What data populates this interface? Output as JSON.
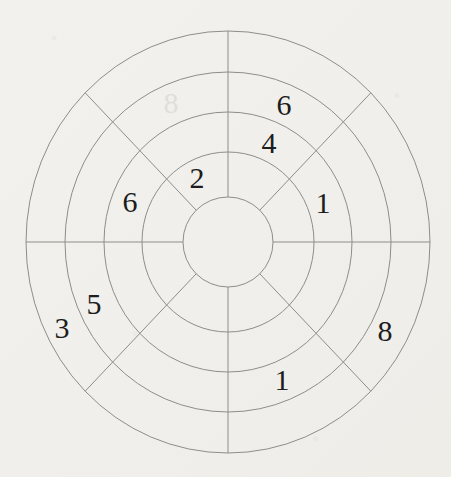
{
  "figure": {
    "kind": "concentric-ring-sector-puzzle",
    "background_color": "#f1f0ec",
    "line_color": "#8d8d8d",
    "text_color": "#1d1d1d",
    "ghost_color": "#bcbbb1",
    "center": {
      "x": 228,
      "y": 242
    },
    "radii_x": [
      45,
      86,
      124,
      163,
      202
    ],
    "radii_y": [
      45,
      90,
      130,
      170,
      211
    ],
    "num_rings": 4,
    "num_sectors": 8,
    "spoke_angles_deg": [
      0,
      45,
      90,
      135,
      180,
      225,
      270,
      315
    ],
    "entries": [
      {
        "value": "6",
        "ring": 3,
        "sector": "N-NE",
        "x": 284,
        "y": 104
      },
      {
        "value": "4",
        "ring": 2,
        "sector": "N-NE",
        "x": 269,
        "y": 142
      },
      {
        "value": "1",
        "ring": 2,
        "sector": "NE-E",
        "x": 323,
        "y": 202
      },
      {
        "value": "8",
        "ring": 4,
        "sector": "E-SE",
        "x": 385,
        "y": 330
      },
      {
        "value": "1",
        "ring": 3,
        "sector": "SE-S",
        "x": 282,
        "y": 379
      },
      {
        "value": "3",
        "ring": 4,
        "sector": "SW-W",
        "x": 62,
        "y": 327
      },
      {
        "value": "5",
        "ring": 3,
        "sector": "SW-W",
        "x": 94,
        "y": 303
      },
      {
        "value": "6",
        "ring": 2,
        "sector": "W-NW",
        "x": 130,
        "y": 201
      },
      {
        "value": "2",
        "ring": 1,
        "sector": "NW-N",
        "x": 197,
        "y": 177
      }
    ],
    "bleedthrough_artifact": {
      "glyph": "8",
      "x": 171,
      "y": 102,
      "mirrored": true
    }
  }
}
